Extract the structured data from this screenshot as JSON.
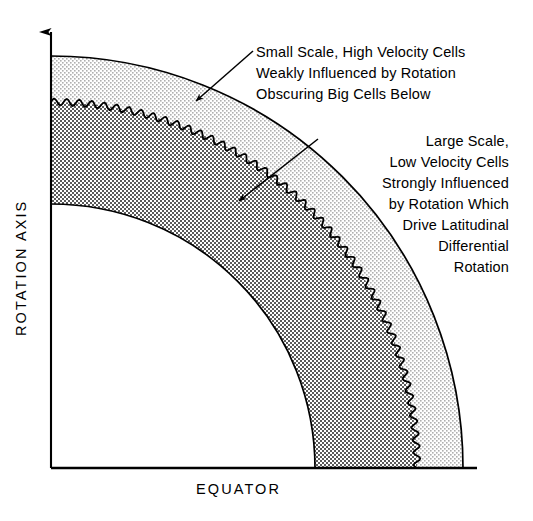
{
  "figure": {
    "kind": "quarter-annulus stellar convection zone schematic",
    "background_color": "#ffffff",
    "line_color": "#000000"
  },
  "axes": {
    "vertical_label": "ROTATION AXIS",
    "horizontal_label": "EQUATOR"
  },
  "annotations": [
    {
      "id": "outer-zone-note",
      "align": "left",
      "lines": [
        "Small Scale, High Velocity Cells",
        "Weakly Influenced by Rotation",
        "Obscuring Big Cells Below"
      ]
    },
    {
      "id": "inner-zone-note",
      "align": "right",
      "lines": [
        "Large Scale,",
        "Low Velocity Cells",
        "Strongly Influenced",
        "by Rotation Which",
        "Drive Latitudinal",
        "Differential",
        "Rotation"
      ]
    }
  ],
  "regions": [
    {
      "id": "outer-band",
      "name": "small-scale-high-velocity-shell",
      "fill": "#f2f2f2",
      "pattern": "sparse-dither"
    },
    {
      "id": "inner-band",
      "name": "large-scale-low-velocity-shell",
      "fill": "#c9c9c9",
      "pattern": "dense-checker-dither"
    },
    {
      "id": "core",
      "name": "radiative-core",
      "fill": "#ffffff",
      "pattern": "none"
    }
  ],
  "geometry": {
    "origin_x": 51,
    "origin_y": 468,
    "outer_radius": 412,
    "wavy_radius": 366,
    "inner_radius": 264,
    "baseline_end_x": 477,
    "axis_top_y": 26
  },
  "colors": {
    "stroke": "#000000",
    "outer_band_fill": "#f2f2f2",
    "inner_band_fill": "#c9c9c9",
    "page_background": "#ffffff"
  }
}
